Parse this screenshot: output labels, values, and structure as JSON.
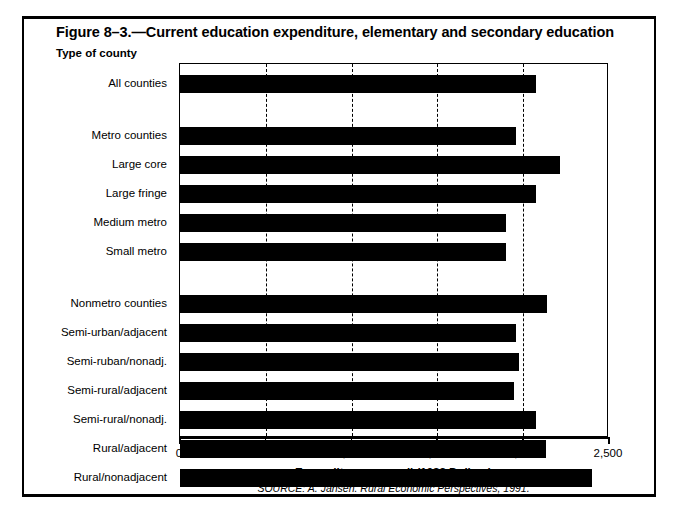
{
  "figure": {
    "title": "Figure 8–3.—Current education expenditure, elementary and secondary education",
    "axis_caption": "Type of county",
    "source": "SOURCE: A. Jansen. Rural Economic Perspectives, 1991."
  },
  "chart_data": {
    "type": "bar",
    "orientation": "horizontal",
    "title": "Figure 8–3.—Current education expenditure, elementary and secondary education",
    "xlabel": "Expenditure per pupil (1982 Dollars)",
    "ylabel": "Type of county",
    "xlim": [
      0,
      2500
    ],
    "xticks": [
      0,
      500,
      1000,
      1500,
      2000,
      2500
    ],
    "xtick_labels": [
      "0",
      "500",
      "1,000",
      "1,500",
      "2,000",
      "2,500"
    ],
    "gridlines": [
      500,
      1000,
      1500,
      2000
    ],
    "grid": true,
    "legend": "none",
    "bar_color": "#000000",
    "categories": [
      "All counties",
      "Metro counties",
      "Large core",
      "Large fringe",
      "Medium metro",
      "Small metro",
      "Nonmetro counties",
      "Semi-urban/adjacent",
      "Semi-ruban/nonadj.",
      "Semi-rural/adjacent",
      "Semi-rural/nonadj.",
      "Rural/adjacent",
      "Rural/nonadjacent"
    ],
    "values": [
      2075,
      1960,
      2215,
      2075,
      1900,
      1900,
      2140,
      1960,
      1975,
      1945,
      2075,
      2135,
      2400
    ],
    "groups": [
      {
        "name": "Total",
        "categories": [
          "All counties"
        ]
      },
      {
        "name": "Metro",
        "categories": [
          "Metro counties",
          "Large core",
          "Large fringe",
          "Medium metro",
          "Small metro"
        ]
      },
      {
        "name": "Nonmetro",
        "categories": [
          "Nonmetro counties",
          "Semi-urban/adjacent",
          "Semi-ruban/nonadj.",
          "Semi-rural/adjacent",
          "Semi-rural/nonadj.",
          "Rural/adjacent",
          "Rural/nonadjacent"
        ]
      }
    ]
  }
}
